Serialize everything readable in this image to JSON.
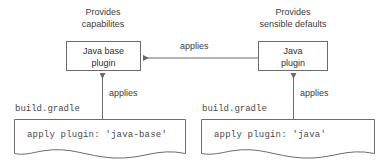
{
  "diagram": {
    "type": "flow-diagram",
    "background_color": "#ffffff",
    "stroke_color": "#6b6b6b",
    "text_color": "#3d3d3d",
    "captions": {
      "left": {
        "line1": "Provides",
        "line2": "capabilites"
      },
      "right": {
        "line1": "Provides",
        "line2": "sensible defaults"
      }
    },
    "nodes": {
      "java_base_plugin": {
        "line1": "Java base",
        "line2": "plugin"
      },
      "java_plugin": {
        "line1": "Java",
        "line2": "plugin"
      }
    },
    "edges": {
      "plugin_to_base": "applies",
      "left_file_to_base": "applies",
      "right_file_to_plugin": "applies"
    },
    "files": {
      "left": {
        "name": "build.gradle",
        "code": "apply plugin: 'java-base'"
      },
      "right": {
        "name": "build.gradle",
        "code": "apply plugin: 'java'"
      }
    }
  }
}
